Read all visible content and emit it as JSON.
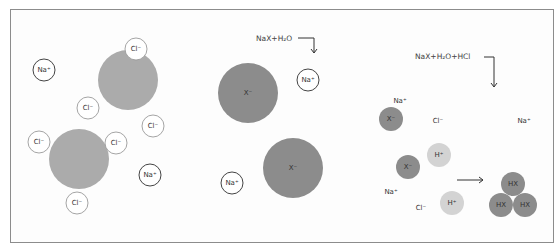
{
  "colors": {
    "frame_border": "#8c8c8c",
    "large_anion": "#ababab",
    "x_anion": "#8c8c8c",
    "proton": "#d3d3d3",
    "hx": "#8c8c8c",
    "na_outline": "#444444",
    "cl_outline": "#9a9a9a",
    "text": "#333333"
  },
  "panels": [
    {
      "id": "left",
      "large_circles": [
        {
          "cx": 128,
          "cy": 80,
          "r": 30
        },
        {
          "cx": 79,
          "cy": 159,
          "r": 30
        }
      ],
      "ions": [
        {
          "label": "Na+",
          "kind": "na",
          "cx": 44,
          "cy": 70
        },
        {
          "label": "Cl−",
          "kind": "cl",
          "cx": 136,
          "cy": 49
        },
        {
          "label": "Cl−",
          "kind": "cl",
          "cx": 88,
          "cy": 108
        },
        {
          "label": "Cl−",
          "kind": "cl",
          "cx": 153,
          "cy": 126
        },
        {
          "label": "Cl−",
          "kind": "cl",
          "cx": 39,
          "cy": 142
        },
        {
          "label": "Cl−",
          "kind": "cl",
          "cx": 116,
          "cy": 143
        },
        {
          "label": "Na+",
          "kind": "na",
          "cx": 150,
          "cy": 175
        },
        {
          "label": "Cl−",
          "kind": "cl",
          "cx": 77,
          "cy": 203
        }
      ]
    },
    {
      "id": "middle",
      "equation": "NaX+H₂O",
      "equation_pos": {
        "x": 256,
        "y": 41
      },
      "arrow": {
        "x1": 298,
        "y": 38,
        "x2": 314,
        "ydown": 53
      },
      "large_circles": [
        {
          "cx": 248,
          "cy": 93,
          "r": 30,
          "label": "X−"
        },
        {
          "cx": 293,
          "cy": 168,
          "r": 30,
          "label": "X−"
        }
      ],
      "ions": [
        {
          "label": "Na+",
          "kind": "na",
          "cx": 308,
          "cy": 80
        },
        {
          "label": "Na+",
          "kind": "na",
          "cx": 232,
          "cy": 183
        }
      ]
    },
    {
      "id": "right",
      "equation": "NaX+H₂O+HCl",
      "equation_pos": {
        "x": 415,
        "y": 59
      },
      "arrow": {
        "x1": 484,
        "y": 57,
        "x2": 494,
        "ydown": 87
      },
      "free_labels": [
        {
          "label": "Na+",
          "x": 400,
          "y": 101
        },
        {
          "label": "Cl−",
          "x": 438,
          "y": 121
        },
        {
          "label": "Na+",
          "x": 524,
          "y": 121
        },
        {
          "label": "Na+",
          "x": 391,
          "y": 192
        },
        {
          "label": "Cl−",
          "x": 421,
          "y": 208
        }
      ],
      "small_circles": [
        {
          "label": "X−",
          "kind": "x",
          "cx": 391,
          "cy": 119
        },
        {
          "label": "H+",
          "kind": "h",
          "cx": 439,
          "cy": 155
        },
        {
          "label": "X−",
          "kind": "x",
          "cx": 408,
          "cy": 167
        },
        {
          "label": "H+",
          "kind": "h",
          "cx": 452,
          "cy": 203
        },
        {
          "label": "HX",
          "kind": "hx",
          "cx": 513,
          "cy": 184
        },
        {
          "label": "HX",
          "kind": "hx",
          "cx": 501,
          "cy": 205
        },
        {
          "label": "HX",
          "kind": "hx",
          "cx": 525,
          "cy": 205
        }
      ],
      "reaction_arrow": {
        "x1": 457,
        "x2": 483,
        "y": 180
      }
    }
  ]
}
